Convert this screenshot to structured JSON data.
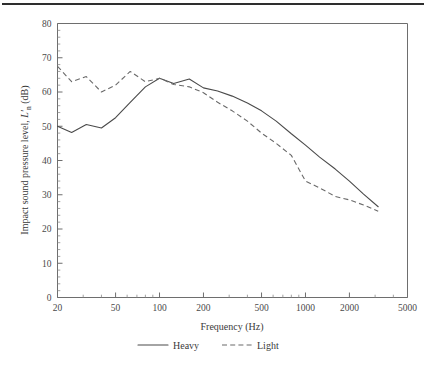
{
  "figure": {
    "background": "#ffffff",
    "line_color": "#4a4a4a",
    "rule_color": "#2e2e2e"
  },
  "chart_data": {
    "type": "line",
    "title": "",
    "xlabel": "Frequency (Hz)",
    "ylabel": "Impact sound pressure level, L'n (dB)",
    "ylabel_main": "Impact sound pressure level, ",
    "ylabel_symbol": "L",
    "ylabel_prime": "′",
    "ylabel_sub": "n",
    "ylabel_unit": " (dB)",
    "xscale": "log",
    "yscale": "linear",
    "xlim": [
      20,
      5000
    ],
    "ylim": [
      0,
      80
    ],
    "grid": false,
    "legend_position": "below",
    "x_tick_labels": [
      "20",
      "50",
      "100",
      "200",
      "500",
      "1000",
      "2000",
      "5000"
    ],
    "x_ticks": [
      20,
      50,
      100,
      200,
      500,
      1000,
      2000,
      5000
    ],
    "y_ticks": [
      0,
      10,
      20,
      30,
      40,
      50,
      60,
      70,
      80
    ],
    "y_tick_labels": [
      "0",
      "10",
      "20",
      "30",
      "40",
      "50",
      "60",
      "70",
      "80"
    ],
    "x": [
      20,
      25,
      31.5,
      40,
      50,
      63,
      80,
      100,
      125,
      160,
      200,
      250,
      315,
      400,
      500,
      630,
      800,
      1000,
      1250,
      1600,
      2000,
      2500,
      3150
    ],
    "series": [
      {
        "name": "Heavy",
        "style": "solid",
        "color": "#4a4a4a",
        "values": [
          50.0,
          48.2,
          50.5,
          49.5,
          52.5,
          57.0,
          61.5,
          64.0,
          62.5,
          63.8,
          61.2,
          60.3,
          58.8,
          56.8,
          54.5,
          51.5,
          47.8,
          44.5,
          41.0,
          37.5,
          34.0,
          30.2,
          26.5
        ]
      },
      {
        "name": "Light",
        "style": "dashed",
        "color": "#6a6a6a",
        "values": [
          67.5,
          63.0,
          64.5,
          60.0,
          62.0,
          66.0,
          63.0,
          64.0,
          62.2,
          61.5,
          59.8,
          57.0,
          54.5,
          51.5,
          48.0,
          45.0,
          41.5,
          34.0,
          32.0,
          29.5,
          28.5,
          27.0,
          25.2
        ]
      }
    ],
    "legend": [
      {
        "label": "Heavy",
        "style": "solid"
      },
      {
        "label": "Light",
        "style": "dashed"
      }
    ]
  }
}
